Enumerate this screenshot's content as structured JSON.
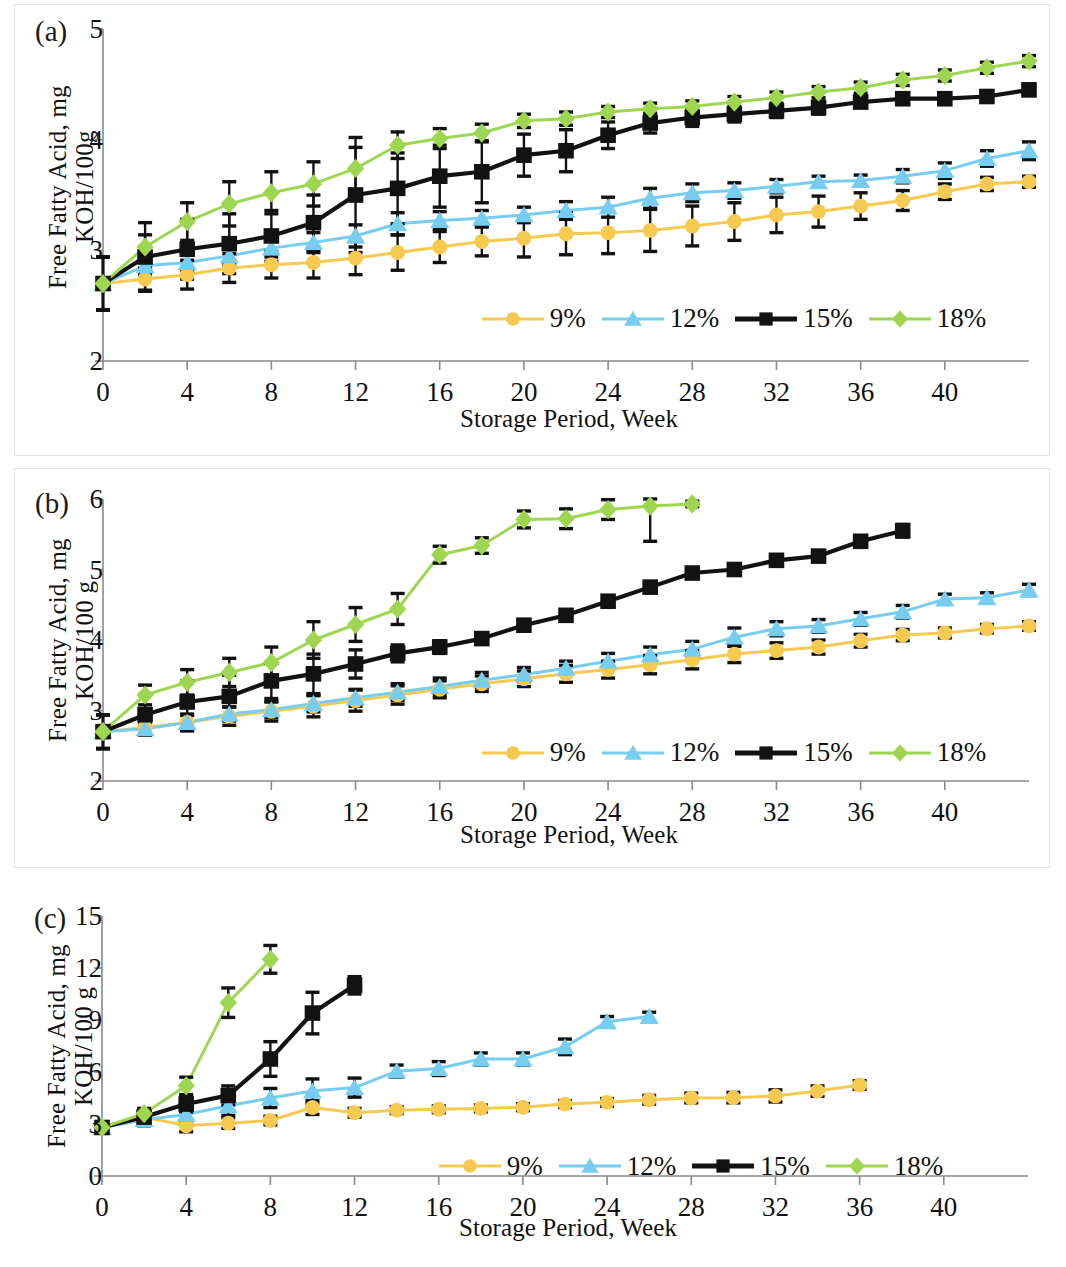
{
  "figure": {
    "series_colors": {
      "9%": "#f6ca50",
      "12%": "#76cdf0",
      "15%": "#121212",
      "18%": "#9ed652"
    },
    "legend_labels": [
      "9%",
      "12%",
      "15%",
      "18%"
    ],
    "xlabel": "Storage Period, Week"
  },
  "panels": [
    {
      "tag": "(a)",
      "ylabel": "Free Fatty Acid, mg\nKOH/100g",
      "xlabel": "Storage Period, Week",
      "yticks": [
        "2",
        "3",
        "4",
        "5"
      ],
      "xticks": [
        "0",
        "4",
        "8",
        "12",
        "16",
        "20",
        "24",
        "28",
        "32",
        "36",
        "40"
      ]
    },
    {
      "tag": "(b)",
      "ylabel": "Free Fatty Acid, mg\nKOH/100 g",
      "xlabel": "Storage Period, Week",
      "yticks": [
        "2",
        "3",
        "4",
        "5",
        "6"
      ],
      "xticks": [
        "0",
        "4",
        "8",
        "12",
        "16",
        "20",
        "24",
        "28",
        "32",
        "36",
        "40"
      ]
    },
    {
      "tag": "(c)",
      "ylabel": "Free Fatty Acid, mg\nKOH/100 g",
      "xlabel": "Storage Period, Week",
      "yticks": [
        "0",
        "3",
        "6",
        "9",
        "12",
        "15"
      ],
      "xticks": [
        "0",
        "4",
        "8",
        "12",
        "16",
        "20",
        "24",
        "28",
        "32",
        "36",
        "40"
      ]
    }
  ],
  "chart_data": [
    {
      "type": "line",
      "panel": "(a)",
      "title": "",
      "xlabel": "Storage Period, Week",
      "ylabel": "Free Fatty Acid, mg KOH/100g",
      "xlim": [
        0,
        44
      ],
      "ylim": [
        2,
        5
      ],
      "xticks": [
        0,
        4,
        8,
        12,
        16,
        20,
        24,
        28,
        32,
        36,
        40
      ],
      "yticks": [
        2,
        3,
        4,
        5
      ],
      "grid": false,
      "legend_position": "inside-bottom-right",
      "errorbars": true,
      "series": [
        {
          "name": "9%",
          "color": "#f6ca50",
          "marker": "circle",
          "x": [
            0,
            2,
            4,
            6,
            8,
            10,
            12,
            14,
            16,
            18,
            20,
            22,
            24,
            26,
            28,
            30,
            32,
            34,
            36,
            38,
            40,
            42,
            44
          ],
          "values": [
            2.7,
            2.74,
            2.78,
            2.84,
            2.87,
            2.89,
            2.93,
            2.98,
            3.03,
            3.08,
            3.11,
            3.15,
            3.16,
            3.18,
            3.22,
            3.26,
            3.32,
            3.35,
            3.4,
            3.45,
            3.53,
            3.6,
            3.62
          ],
          "err": [
            0.24,
            0.1,
            0.13,
            0.13,
            0.12,
            0.14,
            0.15,
            0.16,
            0.14,
            0.13,
            0.17,
            0.19,
            0.19,
            0.19,
            0.18,
            0.17,
            0.16,
            0.14,
            0.12,
            0.09,
            0.07,
            0.06,
            0.05
          ]
        },
        {
          "name": "12%",
          "color": "#76cdf0",
          "marker": "triangle",
          "x": [
            0,
            2,
            4,
            6,
            8,
            10,
            12,
            14,
            16,
            18,
            20,
            22,
            24,
            26,
            28,
            30,
            32,
            34,
            36,
            38,
            40,
            42,
            44
          ],
          "values": [
            2.7,
            2.86,
            2.89,
            2.95,
            3.02,
            3.07,
            3.13,
            3.24,
            3.27,
            3.29,
            3.32,
            3.36,
            3.39,
            3.47,
            3.52,
            3.54,
            3.58,
            3.62,
            3.63,
            3.67,
            3.72,
            3.83,
            3.9
          ],
          "err": [
            0.24,
            0.08,
            0.08,
            0.08,
            0.08,
            0.09,
            0.1,
            0.1,
            0.08,
            0.07,
            0.07,
            0.08,
            0.09,
            0.09,
            0.08,
            0.07,
            0.06,
            0.05,
            0.05,
            0.06,
            0.07,
            0.07,
            0.08
          ]
        },
        {
          "name": "15%",
          "color": "#121212",
          "marker": "square",
          "x": [
            0,
            2,
            4,
            6,
            8,
            10,
            12,
            14,
            16,
            18,
            20,
            22,
            24,
            26,
            28,
            30,
            32,
            34,
            36,
            38,
            40,
            42,
            44
          ],
          "values": [
            2.7,
            2.94,
            3.01,
            3.06,
            3.13,
            3.25,
            3.5,
            3.56,
            3.67,
            3.71,
            3.86,
            3.9,
            4.04,
            4.15,
            4.2,
            4.23,
            4.26,
            4.29,
            4.34,
            4.37,
            4.37,
            4.39,
            4.45
          ],
          "err": [
            0.24,
            0.31,
            0.27,
            0.27,
            0.23,
            0.25,
            0.52,
            0.32,
            0.28,
            0.28,
            0.19,
            0.19,
            0.12,
            0.09,
            0.08,
            0.07,
            0.06,
            0.06,
            0.05,
            0.05,
            0.05,
            0.05,
            0.05
          ]
        },
        {
          "name": "18%",
          "color": "#9ed652",
          "marker": "diamond",
          "x": [
            0,
            2,
            4,
            6,
            8,
            10,
            12,
            14,
            16,
            18,
            20,
            22,
            24,
            26,
            28,
            30,
            32,
            34,
            36,
            38,
            40,
            42,
            44
          ],
          "values": [
            2.7,
            3.03,
            3.26,
            3.42,
            3.52,
            3.6,
            3.74,
            3.95,
            4.01,
            4.06,
            4.17,
            4.19,
            4.25,
            4.28,
            4.3,
            4.34,
            4.38,
            4.43,
            4.47,
            4.54,
            4.58,
            4.65,
            4.71
          ],
          "err": [
            0.24,
            0.11,
            0.17,
            0.2,
            0.19,
            0.2,
            0.19,
            0.12,
            0.09,
            0.08,
            0.06,
            0.06,
            0.05,
            0.05,
            0.05,
            0.05,
            0.05,
            0.05,
            0.05,
            0.05,
            0.05,
            0.05,
            0.05
          ]
        }
      ]
    },
    {
      "type": "line",
      "panel": "(b)",
      "title": "",
      "xlabel": "Storage Period, Week",
      "ylabel": "Free Fatty Acid, mg KOH/100 g",
      "xlim": [
        0,
        44
      ],
      "ylim": [
        2,
        6
      ],
      "xticks": [
        0,
        4,
        8,
        12,
        16,
        20,
        24,
        28,
        32,
        36,
        40
      ],
      "yticks": [
        2,
        3,
        4,
        5,
        6
      ],
      "grid": false,
      "legend_position": "inside-bottom-right",
      "errorbars": true,
      "series": [
        {
          "name": "9%",
          "color": "#f6ca50",
          "marker": "circle",
          "x": [
            0,
            2,
            4,
            6,
            8,
            10,
            12,
            14,
            16,
            18,
            20,
            22,
            24,
            26,
            28,
            30,
            32,
            34,
            36,
            38,
            40,
            42,
            44
          ],
          "values": [
            2.7,
            2.76,
            2.83,
            2.92,
            2.99,
            3.06,
            3.14,
            3.22,
            3.3,
            3.38,
            3.45,
            3.52,
            3.58,
            3.65,
            3.72,
            3.8,
            3.85,
            3.9,
            3.99,
            4.07,
            4.1,
            4.16,
            4.2
          ],
          "err": [
            0.24,
            0.1,
            0.12,
            0.13,
            0.14,
            0.15,
            0.15,
            0.13,
            0.12,
            0.11,
            0.11,
            0.12,
            0.12,
            0.13,
            0.13,
            0.12,
            0.11,
            0.1,
            0.09,
            0.08,
            0.07,
            0.06,
            0.06
          ]
        },
        {
          "name": "12%",
          "color": "#76cdf0",
          "marker": "triangle",
          "x": [
            0,
            2,
            4,
            6,
            8,
            10,
            12,
            14,
            16,
            18,
            20,
            22,
            24,
            26,
            28,
            30,
            32,
            34,
            36,
            38,
            40,
            42,
            44
          ],
          "values": [
            2.7,
            2.74,
            2.83,
            2.95,
            3.01,
            3.1,
            3.18,
            3.26,
            3.34,
            3.43,
            3.51,
            3.6,
            3.7,
            3.79,
            3.87,
            4.04,
            4.16,
            4.2,
            4.3,
            4.4,
            4.58,
            4.6,
            4.71
          ],
          "err": [
            0.24,
            0.09,
            0.1,
            0.1,
            0.11,
            0.12,
            0.12,
            0.12,
            0.12,
            0.11,
            0.1,
            0.1,
            0.11,
            0.11,
            0.11,
            0.13,
            0.1,
            0.09,
            0.09,
            0.09,
            0.07,
            0.07,
            0.08
          ]
        },
        {
          "name": "15%",
          "color": "#121212",
          "marker": "square",
          "x": [
            0,
            2,
            4,
            6,
            8,
            10,
            12,
            14,
            16,
            18,
            20,
            22,
            24,
            26,
            28,
            30,
            32,
            34,
            36,
            38
          ],
          "values": [
            2.7,
            2.94,
            3.12,
            3.2,
            3.42,
            3.52,
            3.66,
            3.81,
            3.9,
            4.02,
            4.21,
            4.35,
            4.55,
            4.75,
            4.95,
            5.0,
            5.13,
            5.19,
            5.4,
            5.55
          ],
          "err": [
            0.24,
            0.28,
            0.3,
            0.3,
            0.25,
            0.28,
            0.2,
            0.12,
            0.09,
            0.08,
            0.07,
            0.07,
            0.07,
            0.07,
            0.07,
            0.07,
            0.07,
            0.07,
            0.07,
            0.09
          ]
        },
        {
          "name": "18%",
          "color": "#9ed652",
          "marker": "diamond",
          "x": [
            0,
            2,
            4,
            6,
            8,
            10,
            12,
            14,
            16,
            18,
            20,
            22,
            24,
            26,
            28
          ],
          "values": [
            2.7,
            3.22,
            3.4,
            3.54,
            3.68,
            4.0,
            4.22,
            4.44,
            5.21,
            5.34,
            5.71,
            5.72,
            5.85,
            5.9,
            5.93
          ],
          "err": [
            0.24,
            0.14,
            0.18,
            0.2,
            0.22,
            0.26,
            0.24,
            0.22,
            0.12,
            0.11,
            0.12,
            0.14,
            0.14,
            0.5,
            0.04
          ]
        }
      ]
    },
    {
      "type": "line",
      "panel": "(c)",
      "title": "",
      "xlabel": "Storage Period, Week",
      "ylabel": "Free Fatty Acid, mg KOH/100 g",
      "xlim": [
        0,
        44
      ],
      "ylim": [
        0,
        15
      ],
      "xticks": [
        0,
        4,
        8,
        12,
        16,
        20,
        24,
        28,
        32,
        36,
        40
      ],
      "yticks": [
        0,
        3,
        6,
        9,
        12,
        15
      ],
      "grid": false,
      "legend_position": "inside-bottom-right",
      "errorbars": true,
      "series": [
        {
          "name": "9%",
          "color": "#f6ca50",
          "marker": "circle",
          "x": [
            0,
            2,
            4,
            6,
            8,
            10,
            12,
            14,
            16,
            18,
            20,
            22,
            24,
            26,
            28,
            30,
            32,
            34,
            36
          ],
          "values": [
            2.8,
            3.4,
            2.9,
            3.05,
            3.2,
            3.95,
            3.65,
            3.8,
            3.85,
            3.9,
            3.97,
            4.15,
            4.25,
            4.4,
            4.5,
            4.52,
            4.62,
            4.9,
            5.25
          ],
          "err": [
            0.15,
            0.25,
            0.35,
            0.3,
            0.25,
            0.4,
            0.25,
            0.2,
            0.2,
            0.2,
            0.2,
            0.2,
            0.22,
            0.25,
            0.28,
            0.3,
            0.35,
            0.3,
            0.25
          ]
        },
        {
          "name": "12%",
          "color": "#76cdf0",
          "marker": "triangle",
          "x": [
            0,
            2,
            4,
            6,
            8,
            10,
            12,
            14,
            16,
            18,
            20,
            22,
            24,
            26
          ],
          "values": [
            2.8,
            3.25,
            3.55,
            4.05,
            4.5,
            4.9,
            5.1,
            6.05,
            6.2,
            6.75,
            6.75,
            7.45,
            8.9,
            9.2
          ],
          "err": [
            0.15,
            0.35,
            0.55,
            0.55,
            0.55,
            0.7,
            0.55,
            0.35,
            0.4,
            0.35,
            0.35,
            0.45,
            0.3,
            0.25
          ]
        },
        {
          "name": "15%",
          "color": "#121212",
          "marker": "square",
          "x": [
            0,
            2,
            4,
            6,
            8,
            10,
            12
          ],
          "values": [
            2.8,
            3.4,
            4.15,
            4.65,
            6.75,
            9.4,
            11.0
          ],
          "err": [
            0.15,
            0.3,
            0.45,
            0.55,
            1.0,
            1.2,
            0.5
          ]
        },
        {
          "name": "18%",
          "color": "#9ed652",
          "marker": "diamond",
          "x": [
            0,
            2,
            4,
            6,
            8
          ],
          "values": [
            2.8,
            3.6,
            5.2,
            10.0,
            12.5
          ],
          "err": [
            0.15,
            0.3,
            0.5,
            0.85,
            0.8
          ]
        }
      ]
    }
  ]
}
